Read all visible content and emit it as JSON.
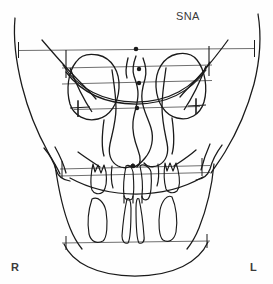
{
  "figure": {
    "type": "pa-cephalometric-tracing",
    "title_label": "SNA",
    "background_color": "#fefefe",
    "trace_color": "#1a1a1a",
    "reference_line_color": "#6f6f6f",
    "label_color": "#3a3a3a",
    "width": 273,
    "height": 284
  },
  "labels": {
    "landmark_label": "SNA",
    "side_right": "R",
    "side_left": "L"
  },
  "anatomy": {
    "skull_outline": "cranial and facial lateral contours",
    "orbit_right": "right orbital rim outline",
    "orbit_left": "left orbital rim outline",
    "nasal_cavity": "piriform aperture with nasal septum",
    "maxillary_teeth": "upper incisors, canines and molars",
    "mandibular_teeth": "lower incisors and molars",
    "mandible_border": "inferior mandibular border curve"
  },
  "reference_lines": [
    {
      "name": "supraorbital-horizontal",
      "y": 50,
      "x1": 18,
      "x2": 255,
      "ticks": "both-ends-vertical"
    },
    {
      "name": "orbital-superior-horizontal",
      "y": 67,
      "x1": 62,
      "x2": 212,
      "ticks": "none"
    },
    {
      "name": "orbital-inferior-horizontal",
      "y": 82,
      "x1": 62,
      "x2": 212,
      "ticks": "none"
    },
    {
      "name": "jugale-horizontal",
      "y": 108,
      "x1": 72,
      "x2": 202,
      "ticks": "both-ends-cross"
    },
    {
      "name": "occlusal-upper-horizontal",
      "y": 168,
      "x1": 58,
      "x2": 212,
      "ticks": "both-ends-vertical"
    },
    {
      "name": "occlusal-lower-horizontal",
      "y": 175,
      "x1": 58,
      "x2": 212,
      "ticks": "both-ends-vertical"
    },
    {
      "name": "mandibular-horizontal",
      "y": 242,
      "x1": 60,
      "x2": 212,
      "ticks": "both-ends-vertical"
    }
  ],
  "landmarks": [
    {
      "name": "crista-galli",
      "x": 136,
      "y": 50
    },
    {
      "name": "nasal-superior",
      "x": 139,
      "y": 69
    },
    {
      "name": "nasal-middle",
      "x": 139,
      "y": 83
    },
    {
      "name": "anterior-nasal-spine-upper",
      "x": 137,
      "y": 108
    },
    {
      "name": "anterior-nasal-spine",
      "x": 133,
      "y": 166
    }
  ]
}
